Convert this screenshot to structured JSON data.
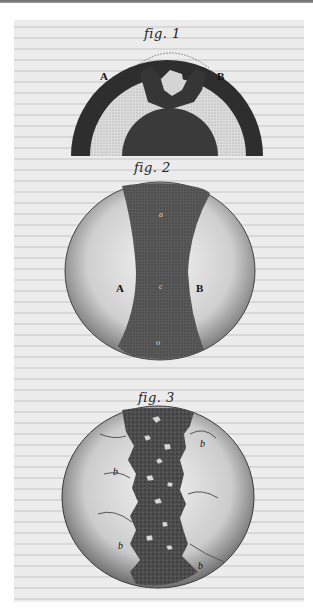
{
  "plate": {
    "background": "#ececec",
    "ink": "#2a2a2a"
  },
  "figures": [
    {
      "caption": "fig. 1",
      "description": "hemispherical cross-section with concentric dark and light layers",
      "labels": {
        "left": "A",
        "right": "B"
      }
    },
    {
      "caption": "fig. 2",
      "description": "sphere with dark vertical central band and two light lobes",
      "labels": {
        "left": "A",
        "right": "B",
        "top": "a",
        "center": "c",
        "bottom": "o"
      }
    },
    {
      "caption": "fig. 3",
      "description": "sphere with rough dark central band containing light fragments, and light lobes with folds",
      "labels": {
        "left_upper": "b",
        "right_upper": "b",
        "left_lower": "b",
        "right_lower": "b"
      }
    }
  ]
}
